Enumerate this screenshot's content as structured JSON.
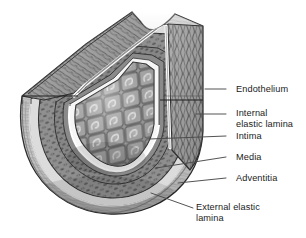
{
  "figure": {
    "type": "anatomical-illustration",
    "style": "grayscale line-and-tone medical illustration",
    "background_color": "#ffffff",
    "ink_color": "#1b1b1b"
  },
  "labels": [
    {
      "id": "endothelium",
      "text": "Endothelium",
      "lines": [
        "Endothelium"
      ],
      "text_x": 236,
      "text_y": 84,
      "leader": {
        "x1": 226,
        "y1": 89,
        "x2": 205,
        "y2": 89
      }
    },
    {
      "id": "internal-elastic-lamina",
      "text": "Internal\nelastic lamina",
      "lines": [
        "Internal",
        "elastic lamina"
      ],
      "text_x": 236,
      "text_y": 108,
      "leader": {
        "x1": 226,
        "y1": 114,
        "x2": 196,
        "y2": 114
      }
    },
    {
      "id": "intima",
      "text": "Intima",
      "lines": [
        "Intima"
      ],
      "text_x": 236,
      "text_y": 131,
      "leader": {
        "x1": 226,
        "y1": 136,
        "x2": 150,
        "y2": 139
      }
    },
    {
      "id": "media",
      "text": "Media",
      "lines": [
        "Media"
      ],
      "text_x": 236,
      "text_y": 152,
      "leader": {
        "x1": 226,
        "y1": 157,
        "x2": 156,
        "y2": 168
      }
    },
    {
      "id": "adventitia",
      "text": "Adventitia",
      "lines": [
        "Adventitia"
      ],
      "text_x": 236,
      "text_y": 173,
      "leader": {
        "x1": 226,
        "y1": 178,
        "x2": 178,
        "y2": 183
      }
    },
    {
      "id": "external-elastic-lamina",
      "text": "External elastic\nlamina",
      "lines": [
        "External elastic",
        "lamina"
      ],
      "text_x": 196,
      "text_y": 205,
      "leader": {
        "x1": 193,
        "y1": 208,
        "x2": 151,
        "y2": 193
      }
    }
  ],
  "palette": {
    "lumen_cell_fill": "#8e8e8e",
    "lumen_cell_light": "#c9c9c9",
    "lumen_cell_dark": "#6a6a6a",
    "media_tone": "#9a9a9a",
    "media_dark_speck": "#5e5e5e",
    "adventitia_tone": "#cfcfcf",
    "elastic_lamina_white": "#f4f4f4",
    "outline": "#2a2a2a",
    "shadow": "#707070",
    "leader_line": "#4a4a4a"
  },
  "structures": [
    {
      "name": "lumen-endothelial-sheet",
      "description": "diamond-tiled endothelial cells lining the lumen"
    },
    {
      "name": "internal-elastic-lamina-band",
      "description": "bright white wavy band beneath endothelium"
    },
    {
      "name": "intima-layer",
      "description": "thin layer between endothelium and media"
    },
    {
      "name": "media-layer",
      "description": "thick speckled smooth-muscle layer"
    },
    {
      "name": "external-elastic-lamina-band",
      "description": "pale band outside the media"
    },
    {
      "name": "adventitia-layer",
      "description": "outermost pale fibrous coat"
    },
    {
      "name": "left-cut-face",
      "description": "obliquely cut wall face upper left"
    },
    {
      "name": "right-cut-face",
      "description": "vertically striated cut face upper right"
    },
    {
      "name": "top-notch",
      "description": "saddle notch between the two cut edges"
    }
  ]
}
